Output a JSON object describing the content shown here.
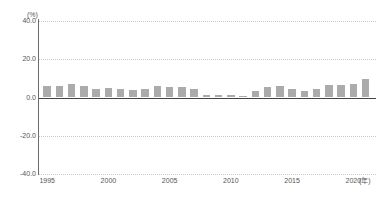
{
  "chart_title": "",
  "axes": {
    "y_unit": "(%)",
    "x_unit": "(年)",
    "y_ticks": [
      "40.0",
      "20.0",
      "0.0",
      "-20.0",
      "-40.0"
    ],
    "x_ticks": [
      "1995",
      "2000",
      "2005",
      "2010",
      "2015",
      "2020"
    ]
  },
  "style": {
    "bar_color": "#ababab",
    "axis_color": "#6b6b6b",
    "grid_color": "#c8c8c8",
    "zero_line_color": "#444444",
    "text_color": "#555555"
  },
  "chart_data": {
    "type": "bar",
    "title": "",
    "xlabel": "(年)",
    "ylabel": "(%)",
    "ylim": [
      -40.0,
      40.0
    ],
    "ytick_step": 20.0,
    "grid": true,
    "legend": "none",
    "categories": [
      "1995",
      "1996",
      "1997",
      "1998",
      "1999",
      "2000",
      "2001",
      "2002",
      "2003",
      "2004",
      "2005",
      "2006",
      "2007",
      "2008",
      "2009",
      "2010",
      "2011",
      "2012",
      "2013",
      "2014",
      "2015",
      "2016",
      "2017",
      "2018",
      "2019",
      "2020",
      "2021"
    ],
    "values": [
      5.8,
      6.0,
      7.0,
      5.8,
      4.6,
      5.2,
      4.5,
      4.0,
      4.2,
      5.8,
      5.4,
      5.3,
      4.4,
      1.5,
      1.3,
      1.4,
      0.6,
      3.6,
      5.6,
      6.1,
      4.5,
      3.6,
      4.6,
      6.6,
      6.6,
      7.0,
      9.8
    ],
    "series": [
      {
        "name": "値",
        "values": [
          5.8,
          6.0,
          7.0,
          5.8,
          4.6,
          5.2,
          4.5,
          4.0,
          4.2,
          5.8,
          5.4,
          5.3,
          4.4,
          1.5,
          1.3,
          1.4,
          0.6,
          3.6,
          5.6,
          6.1,
          4.5,
          3.6,
          4.6,
          6.6,
          6.6,
          7.0,
          9.8
        ]
      }
    ]
  }
}
